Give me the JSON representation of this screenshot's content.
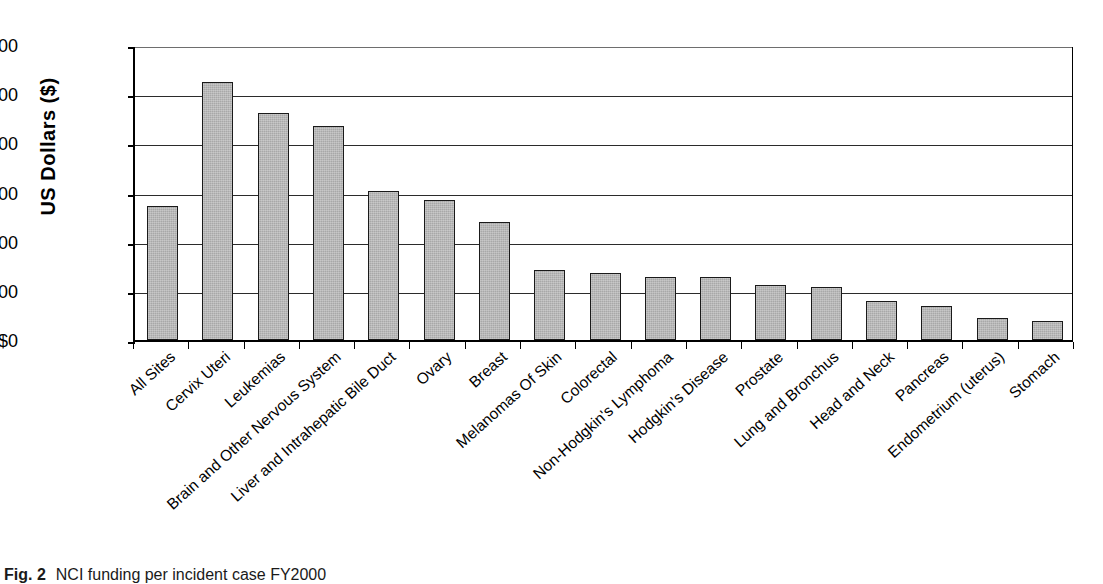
{
  "caption": {
    "figure_number": "Fig. 2",
    "text": "NCI funding per incident case FY2000"
  },
  "chart_data": {
    "type": "bar",
    "title": "",
    "xlabel": "",
    "ylabel": "US  Dollars ($)",
    "ylim": [
      0,
      6000
    ],
    "ytick_values": [
      0,
      1000,
      2000,
      3000,
      4000,
      5000,
      6000
    ],
    "ytick_labels": [
      "$0",
      "$1,000",
      "$2,000",
      "$3,000",
      "$4,000",
      "$5,000",
      "$6,000"
    ],
    "grid": true,
    "grid_axis": "y",
    "legend": "none",
    "bar_color": "#a8a8a8",
    "bar_edge_color": "#1a1a1a",
    "categories": [
      "All Sites",
      "Cervix Uteri",
      "Leukemias",
      "Brain and Other Nervous System",
      "Liver and Intrahepatic Bile Duct",
      "Ovary",
      "Breast",
      "Melanomas Of Skin",
      "Colorectal",
      "Non-Hodgkin's Lymphoma",
      "Hodgkin's Disease",
      "Prostate",
      "Lung and Bronchus",
      "Head and Neck",
      "Pancreas",
      "Endometrium (uterus)",
      "Stomach"
    ],
    "values": [
      2730,
      5240,
      4620,
      4360,
      3040,
      2840,
      2400,
      1430,
      1370,
      1280,
      1280,
      1120,
      1070,
      790,
      700,
      440,
      390
    ]
  }
}
